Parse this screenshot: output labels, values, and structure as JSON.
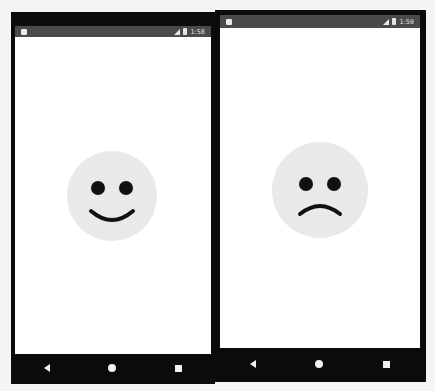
{
  "phones": [
    {
      "status_bar": {
        "time": "1:58",
        "notification_icon": "sd-card-icon",
        "signal_icon": "signal-icon",
        "battery_icon": "battery-icon"
      },
      "face": {
        "expression": "happy",
        "face_color": "#e9e9e9",
        "feature_color": "#111111"
      },
      "nav_bar": {
        "buttons": [
          "back",
          "home",
          "recents"
        ]
      }
    },
    {
      "status_bar": {
        "time": "1:59",
        "notification_icon": "sd-card-icon",
        "signal_icon": "signal-icon",
        "battery_icon": "battery-icon"
      },
      "face": {
        "expression": "sad",
        "face_color": "#e9e9e9",
        "feature_color": "#111111"
      },
      "nav_bar": {
        "buttons": [
          "back",
          "home",
          "recents"
        ]
      }
    }
  ]
}
